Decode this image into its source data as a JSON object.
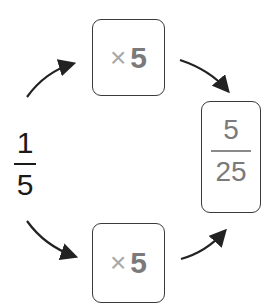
{
  "start_fraction": {
    "numerator": "1",
    "denominator": "5"
  },
  "top_operation": {
    "symbol": "×",
    "value": "5"
  },
  "bottom_operation": {
    "symbol": "×",
    "value": "5"
  },
  "result_fraction": {
    "numerator": "5",
    "denominator": "25"
  },
  "colors": {
    "stroke": "#3a3a3a",
    "arrow": "#222222",
    "operator_symbol": "#a8a8a8",
    "operator_value": "#7a7a7a",
    "result_text": "#7a7a7a",
    "start_text": "#1a1a1a"
  }
}
